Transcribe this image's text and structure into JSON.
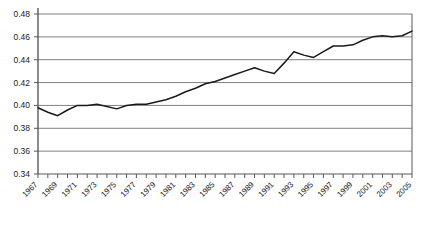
{
  "chart_data": {
    "type": "line",
    "title": "",
    "xlabel": "",
    "ylabel": "",
    "ylim": [
      0.34,
      0.48
    ],
    "ytick_step": 0.02,
    "yticks": [
      "0.34",
      "0.36",
      "0.38",
      "0.40",
      "0.42",
      "0.44",
      "0.46",
      "0.48"
    ],
    "grid": "horizontal",
    "legend": "none",
    "line_color": "#1a1a1a",
    "gridline_color": "#808080",
    "axis_color": "#595959",
    "xtick_labels": [
      "1967",
      "1969",
      "1971",
      "1973",
      "1975",
      "1977",
      "1979",
      "1981",
      "1983",
      "1985",
      "1987",
      "1989",
      "1991",
      "1993",
      "1995",
      "1997",
      "1999",
      "2001",
      "2003",
      "2005"
    ],
    "xtick_label_rotation": -45,
    "x": [
      1967,
      1968,
      1969,
      1970,
      1971,
      1972,
      1973,
      1974,
      1975,
      1976,
      1977,
      1978,
      1979,
      1980,
      1981,
      1982,
      1983,
      1984,
      1985,
      1986,
      1987,
      1988,
      1989,
      1990,
      1991,
      1992,
      1993,
      1994,
      1995,
      1996,
      1997,
      1998,
      1999,
      2000,
      2001,
      2002,
      2003,
      2004,
      2005
    ],
    "values": [
      0.398,
      0.394,
      0.391,
      0.396,
      0.4,
      0.4,
      0.401,
      0.399,
      0.397,
      0.4,
      0.401,
      0.401,
      0.403,
      0.405,
      0.408,
      0.412,
      0.415,
      0.419,
      0.421,
      0.424,
      0.427,
      0.43,
      0.433,
      0.43,
      0.428,
      0.437,
      0.447,
      0.444,
      0.442,
      0.447,
      0.452,
      0.452,
      0.453,
      0.457,
      0.46,
      0.461,
      0.46,
      0.461,
      0.465
    ],
    "series": [
      {
        "name": "series-1",
        "values": [
          0.398,
          0.394,
          0.391,
          0.396,
          0.4,
          0.4,
          0.401,
          0.399,
          0.397,
          0.4,
          0.401,
          0.401,
          0.403,
          0.405,
          0.408,
          0.412,
          0.415,
          0.419,
          0.421,
          0.424,
          0.427,
          0.43,
          0.433,
          0.43,
          0.428,
          0.437,
          0.447,
          0.444,
          0.442,
          0.447,
          0.452,
          0.452,
          0.453,
          0.457,
          0.46,
          0.461,
          0.46,
          0.461,
          0.465
        ]
      }
    ]
  }
}
